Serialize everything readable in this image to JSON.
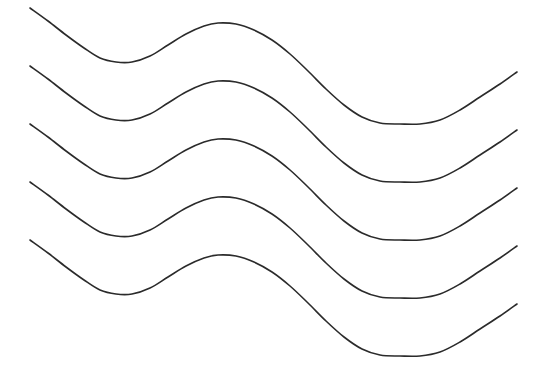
{
  "figure": {
    "background_color": "#ffffff",
    "width": 545,
    "height": 381,
    "stroke_color": "#2b2b2b",
    "stroke_width": 1.6,
    "curve_count": 5,
    "curve_label_prefix": "wave-curve"
  },
  "chart_data": {
    "type": "line",
    "subtitle": "",
    "xlabel": "",
    "ylabel": "",
    "xlim": [
      0,
      545
    ],
    "ylim": [
      0,
      381
    ],
    "grid": false,
    "legend": "none",
    "axes_visible": false,
    "tick_labels_x": [],
    "tick_labels_y": [],
    "annotations": [],
    "vertical_offset": 57.8,
    "shape_key_points": {
      "start": [
        30,
        0
      ],
      "trough_left_start": [
        100,
        55
      ],
      "trough_left_end": [
        132,
        55
      ],
      "peak": [
        218,
        15
      ],
      "trough_right_start": [
        383,
        116
      ],
      "trough_right_end": [
        420,
        116
      ],
      "end": [
        517,
        70
      ]
    },
    "series": [
      {
        "name": "wave-curve-1",
        "offset_y": 8,
        "points": [
          [
            30,
            8
          ],
          [
            48,
            21
          ],
          [
            66,
            35
          ],
          [
            84,
            48
          ],
          [
            100,
            58
          ],
          [
            116,
            62
          ],
          [
            132,
            62
          ],
          [
            150,
            56
          ],
          [
            168,
            45
          ],
          [
            186,
            34
          ],
          [
            204,
            26
          ],
          [
            218,
            23
          ],
          [
            236,
            24
          ],
          [
            254,
            30
          ],
          [
            272,
            40
          ],
          [
            290,
            54
          ],
          [
            308,
            71
          ],
          [
            326,
            89
          ],
          [
            344,
            105
          ],
          [
            362,
            117
          ],
          [
            380,
            123
          ],
          [
            400,
            124
          ],
          [
            420,
            124
          ],
          [
            440,
            120
          ],
          [
            460,
            110
          ],
          [
            480,
            97
          ],
          [
            500,
            84
          ],
          [
            517,
            72
          ]
        ]
      },
      {
        "name": "wave-curve-2",
        "offset_y": 66,
        "points": [
          [
            30,
            66
          ],
          [
            48,
            79
          ],
          [
            66,
            93
          ],
          [
            84,
            106
          ],
          [
            100,
            116
          ],
          [
            116,
            120
          ],
          [
            132,
            120
          ],
          [
            150,
            114
          ],
          [
            168,
            103
          ],
          [
            186,
            92
          ],
          [
            204,
            84
          ],
          [
            218,
            81
          ],
          [
            236,
            82
          ],
          [
            254,
            88
          ],
          [
            272,
            98
          ],
          [
            290,
            112
          ],
          [
            308,
            129
          ],
          [
            326,
            147
          ],
          [
            344,
            163
          ],
          [
            362,
            175
          ],
          [
            380,
            181
          ],
          [
            400,
            182
          ],
          [
            420,
            182
          ],
          [
            440,
            178
          ],
          [
            460,
            168
          ],
          [
            480,
            155
          ],
          [
            500,
            142
          ],
          [
            517,
            130
          ]
        ]
      },
      {
        "name": "wave-curve-3",
        "offset_y": 124,
        "points": [
          [
            30,
            124
          ],
          [
            48,
            137
          ],
          [
            66,
            151
          ],
          [
            84,
            164
          ],
          [
            100,
            174
          ],
          [
            116,
            178
          ],
          [
            132,
            178
          ],
          [
            150,
            172
          ],
          [
            168,
            161
          ],
          [
            186,
            150
          ],
          [
            204,
            142
          ],
          [
            218,
            139
          ],
          [
            236,
            140
          ],
          [
            254,
            146
          ],
          [
            272,
            156
          ],
          [
            290,
            170
          ],
          [
            308,
            187
          ],
          [
            326,
            205
          ],
          [
            344,
            221
          ],
          [
            362,
            233
          ],
          [
            380,
            239
          ],
          [
            400,
            240
          ],
          [
            420,
            240
          ],
          [
            440,
            236
          ],
          [
            460,
            226
          ],
          [
            480,
            213
          ],
          [
            500,
            200
          ],
          [
            517,
            188
          ]
        ]
      },
      {
        "name": "wave-curve-4",
        "offset_y": 182,
        "points": [
          [
            30,
            182
          ],
          [
            48,
            195
          ],
          [
            66,
            209
          ],
          [
            84,
            222
          ],
          [
            100,
            232
          ],
          [
            116,
            236
          ],
          [
            132,
            236
          ],
          [
            150,
            230
          ],
          [
            168,
            219
          ],
          [
            186,
            208
          ],
          [
            204,
            200
          ],
          [
            218,
            197
          ],
          [
            236,
            198
          ],
          [
            254,
            204
          ],
          [
            272,
            214
          ],
          [
            290,
            228
          ],
          [
            308,
            245
          ],
          [
            326,
            263
          ],
          [
            344,
            279
          ],
          [
            362,
            291
          ],
          [
            380,
            297
          ],
          [
            400,
            298
          ],
          [
            420,
            298
          ],
          [
            440,
            294
          ],
          [
            460,
            284
          ],
          [
            480,
            271
          ],
          [
            500,
            258
          ],
          [
            517,
            246
          ]
        ]
      },
      {
        "name": "wave-curve-5",
        "offset_y": 240,
        "points": [
          [
            30,
            240
          ],
          [
            48,
            253
          ],
          [
            66,
            267
          ],
          [
            84,
            280
          ],
          [
            100,
            290
          ],
          [
            116,
            294
          ],
          [
            132,
            294
          ],
          [
            150,
            288
          ],
          [
            168,
            277
          ],
          [
            186,
            266
          ],
          [
            204,
            258
          ],
          [
            218,
            255
          ],
          [
            236,
            256
          ],
          [
            254,
            262
          ],
          [
            272,
            272
          ],
          [
            290,
            286
          ],
          [
            308,
            303
          ],
          [
            326,
            321
          ],
          [
            344,
            337
          ],
          [
            362,
            349
          ],
          [
            380,
            355
          ],
          [
            400,
            356
          ],
          [
            420,
            356
          ],
          [
            440,
            352
          ],
          [
            460,
            342
          ],
          [
            480,
            329
          ],
          [
            500,
            316
          ],
          [
            517,
            304
          ]
        ]
      }
    ]
  }
}
